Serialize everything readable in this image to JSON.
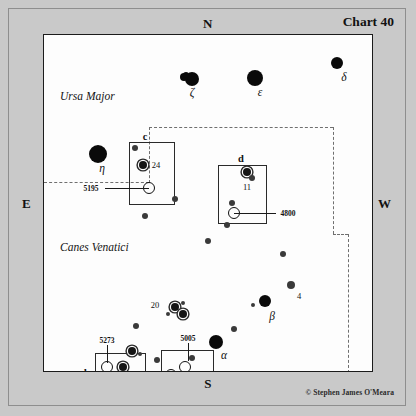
{
  "chart": {
    "title": "Chart 40",
    "credit": "© Stephen James O'Meara",
    "compass": {
      "north": "N",
      "south": "S",
      "east": "E",
      "west": "W"
    }
  },
  "constellations": [
    {
      "name": "Ursa Major",
      "x": 16,
      "y": 55
    },
    {
      "name": "Canes Venatici",
      "x": 16,
      "y": 206
    }
  ],
  "chart_data": {
    "type": "scatter",
    "title": "Chart 40",
    "xlabel": "",
    "ylabel": "",
    "axis_orientation": {
      "top": "N",
      "bottom": "S",
      "left": "E",
      "right": "W"
    },
    "stars": [
      {
        "id": "zeta-a",
        "x": 148,
        "y": 44,
        "size": 7,
        "kind": "bright"
      },
      {
        "id": "zeta-b",
        "x": 140,
        "y": 42,
        "size": 4,
        "kind": "companion"
      },
      {
        "id": "zeta-c",
        "x": 142,
        "y": 40,
        "size": 3,
        "kind": "companion"
      },
      {
        "id": "epsilon",
        "x": 211,
        "y": 43,
        "size": 8,
        "kind": "bright"
      },
      {
        "id": "delta",
        "x": 293,
        "y": 28,
        "size": 6,
        "kind": "bright"
      },
      {
        "id": "eta",
        "x": 54,
        "y": 119,
        "size": 9,
        "kind": "bright"
      },
      {
        "id": "c-top",
        "x": 91,
        "y": 113,
        "size": 3,
        "kind": "faint"
      },
      {
        "id": "star-24",
        "x": 99,
        "y": 130,
        "size": 4,
        "kind": "ring"
      },
      {
        "id": "c-right",
        "x": 131,
        "y": 164,
        "size": 3,
        "kind": "faint"
      },
      {
        "id": "c-below",
        "x": 101,
        "y": 181,
        "size": 3,
        "kind": "faint"
      },
      {
        "id": "d-11a",
        "x": 203,
        "y": 137,
        "size": 4,
        "kind": "ring"
      },
      {
        "id": "d-11b",
        "x": 208,
        "y": 143,
        "size": 3,
        "kind": "faint"
      },
      {
        "id": "d-mid",
        "x": 188,
        "y": 168,
        "size": 3,
        "kind": "faint"
      },
      {
        "id": "d-low",
        "x": 183,
        "y": 190,
        "size": 3,
        "kind": "faint"
      },
      {
        "id": "mid-low",
        "x": 164,
        "y": 206,
        "size": 3,
        "kind": "faint"
      },
      {
        "id": "rt-hi",
        "x": 239,
        "y": 219,
        "size": 3,
        "kind": "faint"
      },
      {
        "id": "star-4",
        "x": 247,
        "y": 250,
        "size": 4,
        "kind": "faint"
      },
      {
        "id": "beta",
        "x": 221,
        "y": 266,
        "size": 6,
        "kind": "bright"
      },
      {
        "id": "beta-w",
        "x": 209,
        "y": 270,
        "size": 2,
        "kind": "faint"
      },
      {
        "id": "mid-s",
        "x": 190,
        "y": 294,
        "size": 3,
        "kind": "faint"
      },
      {
        "id": "alpha",
        "x": 172,
        "y": 307,
        "size": 7,
        "kind": "bright"
      },
      {
        "id": "cl-a",
        "x": 131,
        "y": 272,
        "size": 4,
        "kind": "ring"
      },
      {
        "id": "cl-b",
        "x": 139,
        "y": 268,
        "size": 2,
        "kind": "faint"
      },
      {
        "id": "cl-c",
        "x": 139,
        "y": 279,
        "size": 4,
        "kind": "ring"
      },
      {
        "id": "cl-d",
        "x": 124,
        "y": 279,
        "size": 2,
        "kind": "faint"
      },
      {
        "id": "sw-1",
        "x": 92,
        "y": 291,
        "size": 3,
        "kind": "faint"
      },
      {
        "id": "b-ne1",
        "x": 88,
        "y": 316,
        "size": 4,
        "kind": "ring"
      },
      {
        "id": "b-ne2",
        "x": 96,
        "y": 319,
        "size": 2,
        "kind": "faint"
      },
      {
        "id": "star-25",
        "x": 79,
        "y": 332,
        "size": 4,
        "kind": "ring"
      },
      {
        "id": "b-low",
        "x": 66,
        "y": 344,
        "size": 2,
        "kind": "faint"
      },
      {
        "id": "sw-pair1",
        "x": 43,
        "y": 351,
        "size": 3,
        "kind": "ring"
      },
      {
        "id": "sw-pair2",
        "x": 48,
        "y": 354,
        "size": 3,
        "kind": "ring"
      },
      {
        "id": "a-top",
        "x": 113,
        "y": 325,
        "size": 3,
        "kind": "faint"
      },
      {
        "id": "a-ne",
        "x": 148,
        "y": 323,
        "size": 3,
        "kind": "faint"
      },
      {
        "id": "star-14",
        "x": 157,
        "y": 348,
        "size": 4,
        "kind": "ring"
      }
    ],
    "deep_sky_objects": [
      {
        "ngc": "5195",
        "x": 105,
        "y": 153,
        "r": 5
      },
      {
        "ngc": "4800",
        "x": 190,
        "y": 178,
        "r": 5
      },
      {
        "ngc": "5273",
        "x": 63,
        "y": 332,
        "r": 5
      },
      {
        "ngc": "5005",
        "x": 141,
        "y": 332,
        "r": 5
      },
      {
        "ngc": "5033",
        "x": 127,
        "y": 340,
        "r": 5
      }
    ],
    "inset_boxes": [
      {
        "letter": "c",
        "x": 85,
        "y": 107,
        "w": 46,
        "h": 63,
        "letter_x": 101,
        "letter_y": 101
      },
      {
        "letter": "d",
        "x": 174,
        "y": 130,
        "w": 49,
        "h": 59,
        "letter_x": 197,
        "letter_y": 123
      },
      {
        "letter": "b",
        "x": 51,
        "y": 318,
        "w": 51,
        "h": 39,
        "letter_x": 43,
        "letter_y": 337
      },
      {
        "letter": "a",
        "x": 117,
        "y": 315,
        "w": 53,
        "h": 48,
        "letter_x": 177,
        "letter_y": 340
      }
    ],
    "star_labels": [
      {
        "text": "ζ",
        "x": 148,
        "y": 57,
        "style": "greek"
      },
      {
        "text": "ε",
        "x": 216,
        "y": 57,
        "style": "greek"
      },
      {
        "text": "δ",
        "x": 300,
        "y": 42,
        "style": "greek"
      },
      {
        "text": "η",
        "x": 58,
        "y": 133,
        "style": "greek"
      },
      {
        "text": "β",
        "x": 228,
        "y": 281,
        "style": "greek"
      },
      {
        "text": "α",
        "x": 180,
        "y": 320,
        "style": "greek"
      },
      {
        "text": "24",
        "x": 112,
        "y": 130,
        "style": "num"
      },
      {
        "text": "11",
        "x": 203,
        "y": 152,
        "style": "num"
      },
      {
        "text": "4",
        "x": 255,
        "y": 261,
        "style": "num"
      },
      {
        "text": "20",
        "x": 111,
        "y": 270,
        "style": "num"
      },
      {
        "text": "25",
        "x": 83,
        "y": 345,
        "style": "num"
      },
      {
        "text": "14",
        "x": 143,
        "y": 349,
        "style": "num"
      }
    ],
    "callouts": [
      {
        "ngc": "5195",
        "label_x": 47,
        "label_y": 153,
        "line": {
          "x": 61,
          "y": 153,
          "w": 44,
          "dir": "h"
        }
      },
      {
        "ngc": "4800",
        "label_x": 244,
        "label_y": 178,
        "line": {
          "x": 190,
          "y": 178,
          "w": 42,
          "dir": "h"
        }
      },
      {
        "ngc": "5273",
        "label_x": 63,
        "label_y": 305,
        "line": {
          "x": 63,
          "y": 310,
          "h": 18,
          "dir": "v"
        }
      },
      {
        "ngc": "5005",
        "label_x": 144,
        "label_y": 303,
        "line": {
          "x": 144,
          "y": 308,
          "h": 18,
          "dir": "v"
        }
      },
      {
        "ngc": "5033",
        "label_x": 96,
        "label_y": 340,
        "line": {
          "x": 106,
          "y": 340,
          "w": 19,
          "dir": "h"
        }
      }
    ],
    "boundary_segments": [
      {
        "orient": "h",
        "x": 0,
        "y": 147,
        "len": 105
      },
      {
        "orient": "v",
        "x": 105,
        "y": 92,
        "len": 56
      },
      {
        "orient": "h",
        "x": 105,
        "y": 92,
        "len": 184
      },
      {
        "orient": "v",
        "x": 289,
        "y": 92,
        "len": 107
      },
      {
        "orient": "h",
        "x": 289,
        "y": 199,
        "len": 15
      },
      {
        "orient": "v",
        "x": 304,
        "y": 199,
        "len": 139
      }
    ]
  }
}
